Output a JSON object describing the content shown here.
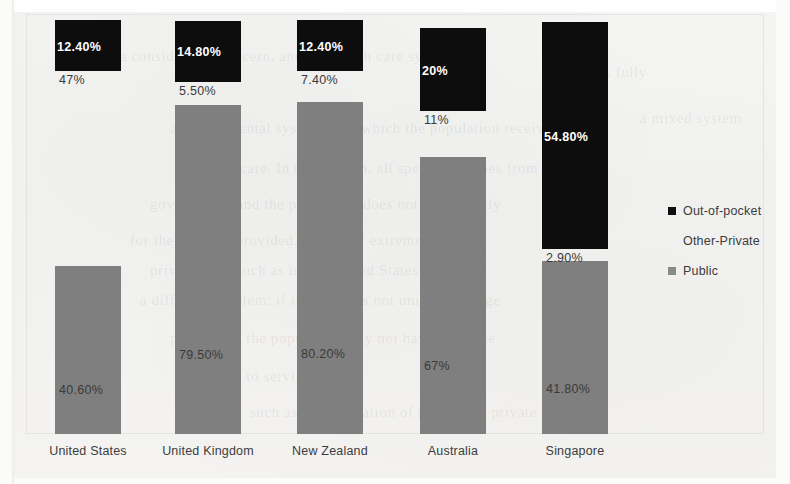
{
  "chart_data": {
    "type": "bar",
    "subtype": "stacked-100-percent",
    "title": "",
    "xlabel": "",
    "ylabel": "",
    "ylim": [
      0,
      100
    ],
    "grid": false,
    "legend_position": "right",
    "categories": [
      "United States",
      "United Kingdom",
      "New Zealand",
      "Australia",
      "Singapore"
    ],
    "series": [
      {
        "name": "Public",
        "color": "#7f7f7f",
        "values": [
          40.6,
          79.5,
          80.2,
          67,
          41.8
        ],
        "labels": [
          "40.60%",
          "79.50%",
          "80.20%",
          "67%",
          "41.80%"
        ]
      },
      {
        "name": "Other-Private",
        "color": "#f1f0ee",
        "values": [
          47,
          5.5,
          7.4,
          11,
          2.9
        ],
        "labels": [
          "47%",
          "5.50%",
          "7.40%",
          "11%",
          "2.90%"
        ]
      },
      {
        "name": "Out-of-pocket",
        "color": "#0d0d0d",
        "values": [
          12.4,
          14.8,
          12.4,
          20,
          54.8
        ],
        "labels": [
          "12.40%",
          "14.80%",
          "12.40%",
          "20%",
          "54.80%"
        ]
      }
    ]
  },
  "legend": {
    "items": [
      {
        "label": "Out-of-pocket",
        "swatch": "#101010"
      },
      {
        "label": "Other-Private",
        "swatch": "#f1f0ee"
      },
      {
        "label": "Public",
        "swatch": "#8a8a8a"
      }
    ]
  },
  "background_text": {
    "lines": [
      "is the",
      "a considerable concern, and the health care system of",
      "is fully",
      "a governmental system from which the population receives",
      "care. In this system, all spending comes from the",
      "government, and the population does not pay directly",
      "for the services provided. The other extreme, of",
      "private care, such as in the United States, presents",
      "a different problem: if insurance is not universal, large",
      "portions of the population may not have adequate",
      "access to services at all.",
      "a mixed system",
      "such as a combination of public and private"
    ]
  }
}
